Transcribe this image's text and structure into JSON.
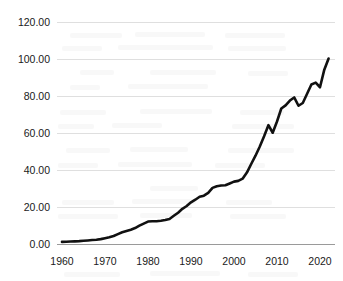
{
  "chart_data": {
    "type": "line",
    "title": "",
    "subtitle": "",
    "xlabel": "",
    "ylabel": "",
    "xlim": [
      1960,
      2022
    ],
    "ylim": [
      0,
      120
    ],
    "grid": true,
    "legend": false,
    "legend_position": "none",
    "line_color": "#111111",
    "gridline_color": "#dcdcdc",
    "axis_color": "#9a9a9a",
    "y_ticks": [
      "0.00",
      "20.00",
      "40.00",
      "60.00",
      "80.00",
      "100.00",
      "120.00"
    ],
    "y_tick_values": [
      0,
      20,
      40,
      60,
      80,
      100,
      120
    ],
    "x_ticks": [
      "1960",
      "1970",
      "1980",
      "1990",
      "2000",
      "2010",
      "2020"
    ],
    "x_tick_values": [
      1960,
      1970,
      1980,
      1990,
      2000,
      2010,
      2020
    ],
    "series": [
      {
        "name": "series-1",
        "x": [
          1960,
          1961,
          1962,
          1963,
          1964,
          1965,
          1966,
          1967,
          1968,
          1969,
          1970,
          1971,
          1972,
          1973,
          1974,
          1975,
          1976,
          1977,
          1978,
          1979,
          1980,
          1981,
          1982,
          1983,
          1984,
          1985,
          1986,
          1987,
          1988,
          1989,
          1990,
          1991,
          1992,
          1993,
          1994,
          1995,
          1996,
          1997,
          1998,
          1999,
          2000,
          2001,
          2002,
          2003,
          2004,
          2005,
          2006,
          2007,
          2008,
          2009,
          2010,
          2011,
          2012,
          2013,
          2014,
          2015,
          2016,
          2017,
          2018,
          2019,
          2020,
          2021,
          2022
        ],
        "values": [
          1.4,
          1.5,
          1.6,
          1.7,
          1.8,
          2.0,
          2.2,
          2.4,
          2.6,
          2.9,
          3.4,
          3.9,
          4.6,
          5.6,
          6.6,
          7.3,
          8.0,
          8.9,
          10.2,
          11.3,
          12.4,
          12.6,
          12.6,
          12.8,
          13.2,
          13.8,
          15.5,
          17.2,
          19.3,
          20.8,
          22.8,
          24.2,
          25.8,
          26.4,
          27.9,
          30.6,
          31.5,
          31.9,
          32.0,
          33.0,
          34.0,
          34.4,
          35.6,
          38.9,
          43.5,
          48.0,
          53.0,
          58.5,
          64.5,
          60.4,
          66.5,
          73.5,
          75.2,
          77.8,
          79.5,
          75.0,
          76.5,
          81.5,
          86.5,
          87.5,
          85.0,
          94.5,
          100.5
        ]
      }
    ]
  }
}
